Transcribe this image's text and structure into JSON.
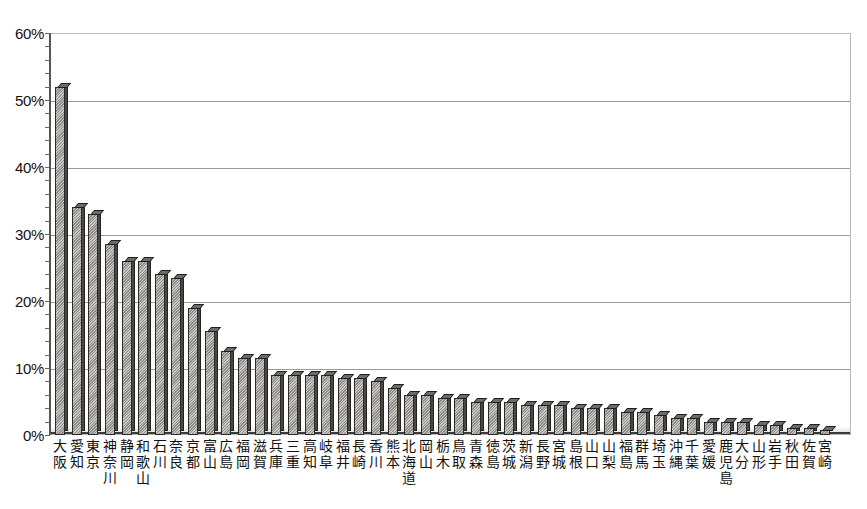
{
  "chart_data": {
    "type": "bar",
    "title": "",
    "xlabel": "",
    "ylabel": "",
    "ylim": [
      0,
      60
    ],
    "y_tick_labels": [
      "0%",
      "10%",
      "20%",
      "30%",
      "40%",
      "50%",
      "60%"
    ],
    "y_ticks": [
      0,
      10,
      20,
      30,
      40,
      50,
      60
    ],
    "grid": true,
    "legend": "none",
    "value_suffix": "%",
    "categories": [
      "大阪",
      "愛知",
      "東京",
      "神奈川",
      "静岡",
      "和歌山",
      "石川",
      "奈良",
      "京都",
      "富山",
      "広島",
      "福岡",
      "滋賀",
      "兵庫",
      "三重",
      "高知",
      "岐阜",
      "福井",
      "長崎",
      "香川",
      "熊本",
      "北海道",
      "岡山",
      "栃木",
      "鳥取",
      "青森",
      "徳島",
      "茨城",
      "新潟",
      "長野",
      "宮城",
      "島根",
      "山口",
      "山梨",
      "福島",
      "群馬",
      "埼玉",
      "沖縄",
      "千葉",
      "愛媛",
      "鹿児島",
      "大分",
      "山形",
      "岩手",
      "秋田",
      "佐賀",
      "宮崎"
    ],
    "category_lines": [
      [
        "大",
        "阪"
      ],
      [
        "愛",
        "知"
      ],
      [
        "東",
        "京"
      ],
      [
        "神",
        "奈",
        "川"
      ],
      [
        "静",
        "岡"
      ],
      [
        "和",
        "歌",
        "山"
      ],
      [
        "石",
        "川"
      ],
      [
        "奈",
        "良"
      ],
      [
        "京",
        "都"
      ],
      [
        "富",
        "山"
      ],
      [
        "広",
        "島"
      ],
      [
        "福",
        "岡"
      ],
      [
        "滋",
        "賀"
      ],
      [
        "兵",
        "庫"
      ],
      [
        "三",
        "重"
      ],
      [
        "高",
        "知"
      ],
      [
        "岐",
        "阜"
      ],
      [
        "福",
        "井"
      ],
      [
        "長",
        "崎"
      ],
      [
        "香",
        "川"
      ],
      [
        "熊",
        "本"
      ],
      [
        "北",
        "海",
        "道"
      ],
      [
        "岡",
        "山"
      ],
      [
        "栃",
        "木"
      ],
      [
        "鳥",
        "取"
      ],
      [
        "青",
        "森"
      ],
      [
        "徳",
        "島"
      ],
      [
        "茨",
        "城"
      ],
      [
        "新",
        "潟"
      ],
      [
        "長",
        "野"
      ],
      [
        "宮",
        "城"
      ],
      [
        "島",
        "根"
      ],
      [
        "山",
        "口"
      ],
      [
        "山",
        "梨"
      ],
      [
        "福",
        "島"
      ],
      [
        "群",
        "馬"
      ],
      [
        "埼",
        "玉"
      ],
      [
        "沖",
        "縄"
      ],
      [
        "千",
        "葉"
      ],
      [
        "愛",
        "媛"
      ],
      [
        "鹿",
        "児",
        "島"
      ],
      [
        "大",
        "分"
      ],
      [
        "山",
        "形"
      ],
      [
        "岩",
        "手"
      ],
      [
        "秋",
        "田"
      ],
      [
        "佐",
        "賀"
      ],
      [
        "宮",
        "崎"
      ]
    ],
    "values": [
      52.0,
      34.0,
      33.0,
      28.5,
      26.0,
      26.0,
      24.0,
      23.5,
      19.0,
      15.5,
      12.5,
      11.5,
      11.5,
      9.0,
      9.0,
      9.0,
      9.0,
      8.5,
      8.5,
      8.0,
      7.0,
      6.0,
      6.0,
      5.5,
      5.5,
      5.0,
      5.0,
      5.0,
      4.5,
      4.5,
      4.5,
      4.0,
      4.0,
      4.0,
      3.5,
      3.5,
      3.0,
      2.5,
      2.5,
      2.0,
      2.0,
      2.0,
      1.5,
      1.5,
      1.0,
      1.0,
      0.8
    ]
  },
  "style": {
    "bar_fill": "#c9c7c4",
    "bar_edge": "#2b2b2b",
    "bar_side": "#4a4744",
    "bar_top": "#6d6a67",
    "grid_color": "#9a9a9a",
    "axis_color": "#555555",
    "background": "#ffffff",
    "text_color": "#111111"
  }
}
